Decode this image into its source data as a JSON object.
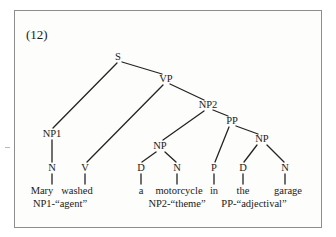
{
  "figure": {
    "example_number": "(12)",
    "sentence": "Mary washed a motorcycle in the garage"
  },
  "tree": {
    "nodes": [
      {
        "id": "S",
        "label": "S",
        "x": 118,
        "y": 57
      },
      {
        "id": "VP",
        "label": "VP",
        "x": 166,
        "y": 79
      },
      {
        "id": "NP2",
        "label": "NP2",
        "x": 208,
        "y": 105
      },
      {
        "id": "PP",
        "label": "PP",
        "x": 232,
        "y": 121
      },
      {
        "id": "NP1",
        "label": "NP1",
        "x": 52,
        "y": 134
      },
      {
        "id": "NPa",
        "label": "NP",
        "x": 160,
        "y": 146
      },
      {
        "id": "NPb",
        "label": "NP",
        "x": 262,
        "y": 139
      },
      {
        "id": "N1",
        "label": "N",
        "x": 52,
        "y": 168
      },
      {
        "id": "V",
        "label": "V",
        "x": 85,
        "y": 168
      },
      {
        "id": "D1",
        "label": "D",
        "x": 141,
        "y": 168
      },
      {
        "id": "N2",
        "label": "N",
        "x": 177,
        "y": 168
      },
      {
        "id": "P",
        "label": "P",
        "x": 214,
        "y": 168
      },
      {
        "id": "D2",
        "label": "D",
        "x": 243,
        "y": 168
      },
      {
        "id": "N3",
        "label": "N",
        "x": 285,
        "y": 168
      }
    ],
    "edges": [
      {
        "from": "S",
        "to": "NP1",
        "x1": 117,
        "y1": 63,
        "x2": 53,
        "y2": 128
      },
      {
        "from": "S",
        "to": "VP",
        "x1": 122,
        "y1": 62,
        "x2": 162,
        "y2": 74
      },
      {
        "from": "VP",
        "to": "V",
        "x1": 163,
        "y1": 85,
        "x2": 87,
        "y2": 162
      },
      {
        "from": "VP",
        "to": "NP2",
        "x1": 170,
        "y1": 84,
        "x2": 204,
        "y2": 100
      },
      {
        "from": "NP2",
        "to": "NPa",
        "x1": 204,
        "y1": 111,
        "x2": 163,
        "y2": 140
      },
      {
        "from": "NP2",
        "to": "PP",
        "x1": 213,
        "y1": 110,
        "x2": 228,
        "y2": 116
      },
      {
        "from": "PP",
        "to": "P",
        "x1": 229,
        "y1": 127,
        "x2": 215,
        "y2": 162
      },
      {
        "from": "PP",
        "to": "NPb",
        "x1": 236,
        "y1": 126,
        "x2": 258,
        "y2": 134
      },
      {
        "from": "NPa",
        "to": "D1",
        "x1": 156,
        "y1": 152,
        "x2": 142,
        "y2": 162
      },
      {
        "from": "NPa",
        "to": "N2",
        "x1": 165,
        "y1": 152,
        "x2": 176,
        "y2": 162
      },
      {
        "from": "NPb",
        "to": "D2",
        "x1": 257,
        "y1": 145,
        "x2": 244,
        "y2": 162
      },
      {
        "from": "NPb",
        "to": "N3",
        "x1": 267,
        "y1": 145,
        "x2": 284,
        "y2": 162
      },
      {
        "from": "NP1",
        "to": "N1",
        "x1": 52,
        "y1": 140,
        "x2": 52,
        "y2": 162
      },
      {
        "from": "N1",
        "to": "Mary",
        "x1": 52,
        "y1": 174,
        "x2": 52,
        "y2": 184
      },
      {
        "from": "V",
        "to": "washed",
        "x1": 85,
        "y1": 174,
        "x2": 85,
        "y2": 184
      },
      {
        "from": "D1",
        "to": "a",
        "x1": 141,
        "y1": 174,
        "x2": 141,
        "y2": 184
      },
      {
        "from": "N2",
        "to": "motorcycle",
        "x1": 177,
        "y1": 174,
        "x2": 177,
        "y2": 184
      },
      {
        "from": "P",
        "to": "in",
        "x1": 214,
        "y1": 174,
        "x2": 214,
        "y2": 184
      },
      {
        "from": "D2",
        "to": "the",
        "x1": 243,
        "y1": 174,
        "x2": 243,
        "y2": 184
      },
      {
        "from": "N3",
        "to": "garage",
        "x1": 285,
        "y1": 174,
        "x2": 285,
        "y2": 184
      }
    ],
    "words": [
      {
        "label": "Mary",
        "x": 42,
        "y": 191
      },
      {
        "label": "washed",
        "x": 77,
        "y": 191
      },
      {
        "label": "a",
        "x": 141,
        "y": 191
      },
      {
        "label": "motorcycle",
        "x": 179,
        "y": 191
      },
      {
        "label": "in",
        "x": 214,
        "y": 191
      },
      {
        "label": "the",
        "x": 243,
        "y": 191
      },
      {
        "label": "garage",
        "x": 288,
        "y": 191
      }
    ],
    "roles": [
      {
        "label": "NP1-“agent”",
        "x": 60,
        "y": 204
      },
      {
        "label": "NP2-“theme”",
        "x": 177,
        "y": 204
      },
      {
        "label": "PP-“adjectival”",
        "x": 254,
        "y": 204
      }
    ]
  },
  "colors": {
    "ink": "#1a1a1a",
    "line": "#242424",
    "frame": "#8d8d8d",
    "paper": "#fdfdfb"
  }
}
